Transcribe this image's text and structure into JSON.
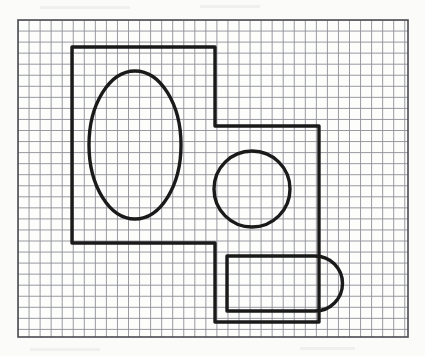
{
  "document": {
    "title": "Engineering Sketch on Graph Paper",
    "medium": "grid-ruled graph paper",
    "description": "Hand-drawn orthographic outline of a stepped plate with an elliptical hole, a circular hole and a rounded-end slot tab.",
    "background_color": "#fbfbfa",
    "ink_color": "#1a1a1a",
    "grid_color": "#8d8f96",
    "grid_minor_color": "#b9bbc0",
    "paper_border_color": "#4a4c52"
  },
  "grid": {
    "label": "graph-paper-grid",
    "left": 18,
    "top": 20,
    "right": 408,
    "bottom": 337,
    "cell_size": 11.05,
    "columns": 35,
    "rows": 28.7,
    "line_width": 0.9,
    "border_width": 1.6
  },
  "figure": {
    "label": "mechanical-part-outline",
    "stroke_width": 3.4,
    "stroke_color": "#1a1a1a",
    "fill": "none",
    "outline": {
      "name": "stepped-plate-outline",
      "vertices": [
        [
          72,
          47
        ],
        [
          215,
          47
        ],
        [
          215,
          126
        ],
        [
          319,
          126
        ],
        [
          319,
          245
        ],
        [
          319,
          322
        ],
        [
          215,
          322
        ],
        [
          215,
          243
        ],
        [
          72,
          243
        ]
      ],
      "closed": true,
      "right_end_cap": {
        "type": "semicircular-arc",
        "center": [
          319,
          283.5
        ],
        "radius": 41.5,
        "extends_to_x": 361,
        "sweep": "clockwise-right"
      }
    },
    "ellipse_hole": {
      "name": "elliptical-hole",
      "center": [
        135,
        145
      ],
      "rx": 46,
      "ry": 74
    },
    "circle_hole": {
      "name": "circular-hole",
      "center": [
        252,
        189
      ],
      "r": 38
    },
    "inner_slot": {
      "name": "rounded-end-slot",
      "left": 227,
      "top": 256,
      "right": 315,
      "bottom": 311,
      "end_cap": {
        "type": "semicircular-arc",
        "center": [
          315,
          283.5
        ],
        "radius": 27.5,
        "extends_to_x": 350
      }
    }
  }
}
